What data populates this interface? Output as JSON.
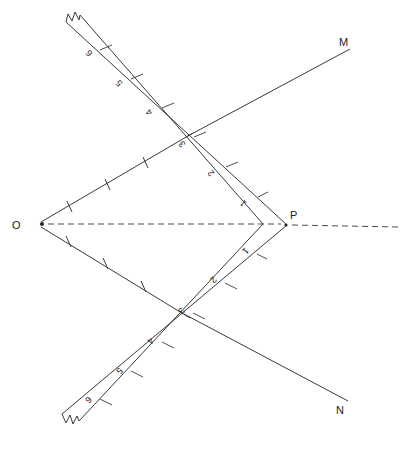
{
  "figure": {
    "background_color": "#ffffff",
    "line_color": "#3a3a3a",
    "label_color": "#1c1c1c",
    "width": 413,
    "height": 449
  },
  "points": [
    {
      "id": "O",
      "label": "O",
      "x": 40,
      "y": 224,
      "label_x": 14,
      "label_y": 228
    },
    {
      "id": "P",
      "label": "P",
      "x": 287,
      "y": 225,
      "label_x": 290,
      "label_y": 218
    },
    {
      "id": "M",
      "label": "M",
      "x": 350,
      "y": 48,
      "label_x": 340,
      "label_y": 45
    },
    {
      "id": "N",
      "label": "N",
      "x": 348,
      "y": 400,
      "label_x": 337,
      "label_y": 413
    }
  ],
  "strip": {
    "description": "V-shaped folded strip with numbered graduations",
    "outer_vertex": {
      "x": 287,
      "y": 225
    },
    "inner_vertex": {
      "x": 263,
      "y": 224
    },
    "upper_arm_outer_end": {
      "x": 66,
      "y": 22
    },
    "upper_arm_inner_end": {
      "x": 80,
      "y": 16
    },
    "lower_arm_outer_end": {
      "x": 62,
      "y": 414
    },
    "lower_arm_inner_end": {
      "x": 79,
      "y": 421
    },
    "upper_segment_labels": [
      "1",
      "2",
      "3",
      "4",
      "5",
      "6"
    ],
    "lower_segment_labels": [
      "1",
      "2",
      "3",
      "4",
      "5",
      "6"
    ],
    "upper_label_positions": [
      {
        "n": "1",
        "x": 247,
        "y": 203,
        "rot": 232
      },
      {
        "n": "2",
        "x": 215,
        "y": 168,
        "rot": 232
      },
      {
        "n": "3",
        "x": 186,
        "y": 139,
        "rot": 232
      },
      {
        "n": "4",
        "x": 152,
        "y": 104,
        "rot": 232
      },
      {
        "n": "5",
        "x": 122,
        "y": 74,
        "rot": 232
      },
      {
        "n": "6",
        "x": 92,
        "y": 45,
        "rot": 232
      }
    ],
    "lower_label_positions": [
      {
        "n": "1",
        "x": 245,
        "y": 250,
        "rot": 128
      },
      {
        "n": "2",
        "x": 214,
        "y": 279,
        "rot": 128
      },
      {
        "n": "3",
        "x": 182,
        "y": 311,
        "rot": 128
      },
      {
        "n": "4",
        "x": 151,
        "y": 342,
        "rot": 128
      },
      {
        "n": "5",
        "x": 120,
        "y": 372,
        "rot": 128
      },
      {
        "n": "6",
        "x": 89,
        "y": 401,
        "rot": 128
      }
    ],
    "break_ends": [
      "upper-left",
      "lower-left"
    ]
  },
  "rays": [
    {
      "id": "ray-O-to-upper",
      "from": "O",
      "to": "upper strip fold",
      "tick_count": 3,
      "style": "solid"
    },
    {
      "id": "ray-O-to-lower",
      "from": "O",
      "to": "lower strip fold",
      "tick_count": 3,
      "style": "solid"
    },
    {
      "id": "ray-to-M",
      "from": "upper strip fold",
      "to": "M",
      "style": "solid"
    },
    {
      "id": "ray-to-N",
      "from": "lower strip fold",
      "to": "N",
      "style": "solid"
    },
    {
      "id": "axis-OP",
      "from": "O",
      "to": "P",
      "style": "dashed"
    },
    {
      "id": "axis-P-extension",
      "from": "P",
      "to": "right edge",
      "style": "dashed"
    }
  ],
  "caption": {
    "text": ""
  }
}
